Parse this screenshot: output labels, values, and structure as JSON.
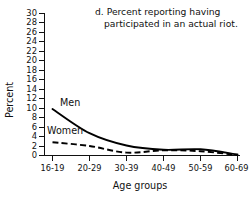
{
  "chart_data": {
    "type": "line",
    "title": "d. Percent reporting having participated in an actual riot.",
    "title_line1": "d. Percent reporting having",
    "title_line2": "participated in an actual riot.",
    "xlabel": "Age groups",
    "ylabel": "Percent",
    "categories": [
      "16-19",
      "20-29",
      "30-39",
      "40-49",
      "50-59",
      "60-69"
    ],
    "ylim": [
      0,
      30
    ],
    "ytick_step": 2,
    "yticks": [
      "0",
      "2",
      "4",
      "6",
      "8",
      "10",
      "12",
      "14",
      "16",
      "18",
      "20",
      "22",
      "24",
      "26",
      "28",
      "30"
    ],
    "grid": false,
    "legend_position": "inline-annotation",
    "series": [
      {
        "name": "Men",
        "style": "solid",
        "color": "#000000",
        "label": "Men",
        "values": [
          9.8,
          4.7,
          2.1,
          1.2,
          1.3,
          0.2
        ]
      },
      {
        "name": "Women",
        "style": "dashed",
        "color": "#000000",
        "label": "Women",
        "values": [
          2.8,
          2.0,
          0.6,
          1.1,
          0.9,
          0.1
        ]
      }
    ]
  }
}
